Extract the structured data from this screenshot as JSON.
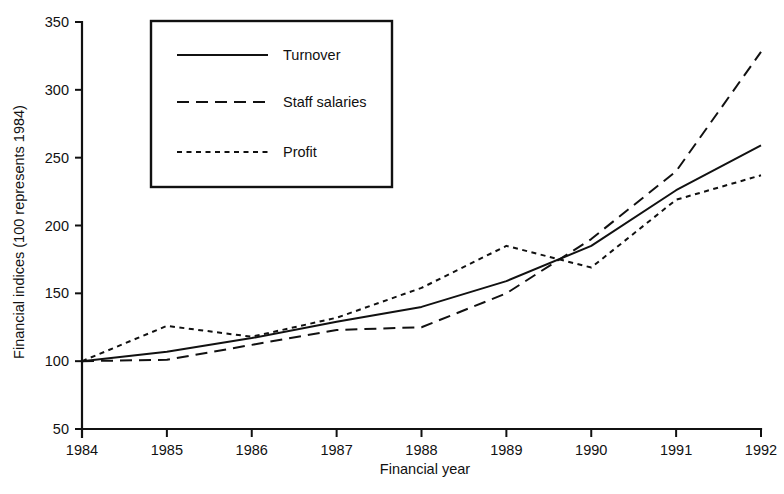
{
  "chart_data": {
    "type": "line",
    "title": "",
    "xlabel": "Financial year",
    "ylabel": "Financial indices (100 represents 1984)",
    "x": [
      1984,
      1985,
      1986,
      1987,
      1988,
      1989,
      1990,
      1991,
      1992
    ],
    "xtick_labels": [
      "1984",
      "1985",
      "1986",
      "1987",
      "1988",
      "1989",
      "1990",
      "1991",
      "1992"
    ],
    "ytick_labels": [
      "50",
      "100",
      "150",
      "200",
      "250",
      "300",
      "350"
    ],
    "yticks": [
      50,
      100,
      150,
      200,
      250,
      300,
      350
    ],
    "xlim": [
      1984,
      1992
    ],
    "ylim": [
      50,
      350
    ],
    "grid": false,
    "legend_position": "upper left",
    "line_color": "#111111",
    "background_color": "#ffffff",
    "series": [
      {
        "name": "Turnover",
        "style": "solid",
        "values": [
          100,
          107,
          117,
          129,
          140,
          159,
          185,
          226,
          259
        ]
      },
      {
        "name": "Staff salaries",
        "style": "long-dashed",
        "values": [
          100,
          101,
          112,
          123,
          125,
          150,
          190,
          240,
          328
        ]
      },
      {
        "name": "Profit",
        "style": "short-dashed",
        "values": [
          100,
          126,
          118,
          132,
          154,
          185,
          169,
          219,
          237
        ]
      }
    ]
  },
  "legend": {
    "items": [
      {
        "label": "Turnover",
        "style": "solid"
      },
      {
        "label": "Staff salaries",
        "style": "long-dashed"
      },
      {
        "label": "Profit",
        "style": "short-dashed"
      }
    ]
  }
}
